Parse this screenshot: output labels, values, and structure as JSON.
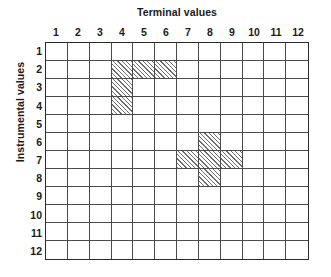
{
  "figure": {
    "x_axis_title": "Terminal values",
    "y_axis_title": "Instrumental values"
  },
  "chart_data": {
    "type": "heatmap",
    "title": "",
    "xlabel": "Terminal values",
    "ylabel": "Instrumental values",
    "grid": true,
    "legend": "none",
    "x": [
      1,
      2,
      3,
      4,
      5,
      6,
      7,
      8,
      9,
      10,
      11,
      12
    ],
    "y": [
      1,
      2,
      3,
      4,
      5,
      6,
      7,
      8,
      9,
      10,
      11,
      12
    ],
    "xlim": [
      1,
      12
    ],
    "ylim": [
      1,
      12
    ],
    "x_tick_labels": [
      "1",
      "2",
      "3",
      "4",
      "5",
      "6",
      "7",
      "8",
      "9",
      "10",
      "11",
      "12"
    ],
    "y_tick_labels": [
      "1",
      "2",
      "3",
      "4",
      "5",
      "6",
      "7",
      "8",
      "9",
      "10",
      "11",
      "12"
    ],
    "fill_style": "diagonal-hatch",
    "filled_cells": [
      {
        "col": 4,
        "row": 2
      },
      {
        "col": 5,
        "row": 2
      },
      {
        "col": 6,
        "row": 2
      },
      {
        "col": 4,
        "row": 3
      },
      {
        "col": 4,
        "row": 4
      },
      {
        "col": 8,
        "row": 6
      },
      {
        "col": 7,
        "row": 7
      },
      {
        "col": 8,
        "row": 7
      },
      {
        "col": 9,
        "row": 7
      },
      {
        "col": 8,
        "row": 8
      }
    ],
    "values": [
      [
        0,
        0,
        0,
        0,
        0,
        0,
        0,
        0,
        0,
        0,
        0,
        0
      ],
      [
        0,
        0,
        0,
        1,
        1,
        1,
        0,
        0,
        0,
        0,
        0,
        0
      ],
      [
        0,
        0,
        0,
        1,
        0,
        0,
        0,
        0,
        0,
        0,
        0,
        0
      ],
      [
        0,
        0,
        0,
        1,
        0,
        0,
        0,
        0,
        0,
        0,
        0,
        0
      ],
      [
        0,
        0,
        0,
        0,
        0,
        0,
        0,
        0,
        0,
        0,
        0,
        0
      ],
      [
        0,
        0,
        0,
        0,
        0,
        0,
        0,
        1,
        0,
        0,
        0,
        0
      ],
      [
        0,
        0,
        0,
        0,
        0,
        0,
        1,
        1,
        1,
        0,
        0,
        0
      ],
      [
        0,
        0,
        0,
        0,
        0,
        0,
        0,
        1,
        0,
        0,
        0,
        0
      ],
      [
        0,
        0,
        0,
        0,
        0,
        0,
        0,
        0,
        0,
        0,
        0,
        0
      ],
      [
        0,
        0,
        0,
        0,
        0,
        0,
        0,
        0,
        0,
        0,
        0,
        0
      ],
      [
        0,
        0,
        0,
        0,
        0,
        0,
        0,
        0,
        0,
        0,
        0,
        0
      ],
      [
        0,
        0,
        0,
        0,
        0,
        0,
        0,
        0,
        0,
        0,
        0,
        0
      ]
    ],
    "colors": {
      "background": "#ffffff",
      "grid_line": "#4a4a4a",
      "border": "#2b2b2b",
      "hatch": "#6e6e6e",
      "text": "#1a1a1a"
    }
  }
}
